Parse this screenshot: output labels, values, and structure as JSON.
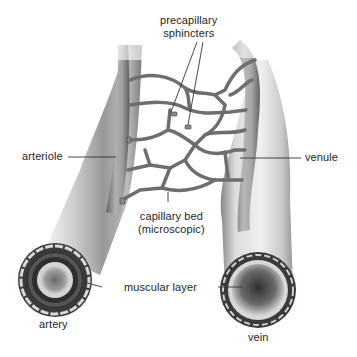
{
  "diagram": {
    "type": "anatomical illustration",
    "labels": {
      "precapillary_sphincters_line1": "precapillary",
      "precapillary_sphincters_line2": "sphincters",
      "arteriole": "arteriole",
      "venule": "venule",
      "capillary_bed_line1": "capillary bed",
      "capillary_bed_line2": "(microscopic)",
      "muscular_layer": "muscular layer",
      "artery": "artery",
      "vein": "vein"
    },
    "colors": {
      "background": "#ffffff",
      "vessel_light": "#e6e6e6",
      "vessel_mid": "#9a9a9a",
      "vessel_dark": "#4a4a4a",
      "capillary": "#7a7a7a",
      "leader_line": "#333333",
      "text": "#1e1e1e"
    }
  }
}
